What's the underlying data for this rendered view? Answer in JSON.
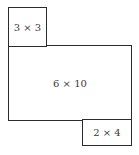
{
  "diagram": {
    "rectangles": [
      {
        "id": "top-left",
        "label": "3 × 3"
      },
      {
        "id": "main",
        "label": "6 × 10"
      },
      {
        "id": "bottom-right",
        "label": "2 × 4"
      }
    ]
  }
}
